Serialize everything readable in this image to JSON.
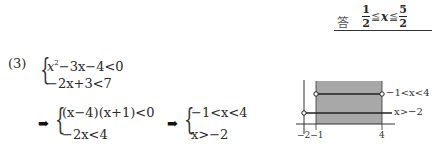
{
  "answer": {
    "label": "答",
    "lower_num": "1",
    "lower_den": "2",
    "op1": "≦",
    "var": "x",
    "op2": "≦",
    "upper_num": "5",
    "upper_den": "2"
  },
  "problem": {
    "number": "(3)",
    "system1": {
      "line1_a": "x",
      "line1_sup": "2",
      "line1_b": "−3x−4<0",
      "line2": "−2x+3<7"
    },
    "arrow": "➡",
    "system2": {
      "line1": "(x−4)(x+1)<0",
      "line2": "−2x<4"
    },
    "system3": {
      "line1": "−1<x<4",
      "line2": "x>−2"
    }
  },
  "graph": {
    "label_upper": "−1<x<4",
    "label_lower": "x>−2",
    "tick_left": "−2−1",
    "tick_right": "4",
    "shade_color": "#a8a8a8",
    "line_color": "#333333"
  }
}
